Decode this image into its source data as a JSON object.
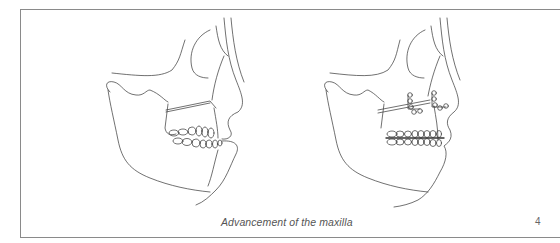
{
  "figure": {
    "caption": "Advancement of the maxilla",
    "page_number": "4",
    "panels": [
      {
        "name": "preoperative-skull-profile",
        "description": "Lateral skull line drawing showing maxillary osteotomy line before advancement"
      },
      {
        "name": "postoperative-skull-profile",
        "description": "Lateral skull line drawing with advanced maxilla fixed by two L-shaped bone plates with screws"
      }
    ],
    "colors": {
      "frame": "#8a8a8a",
      "line": "#333333",
      "caption": "#555555"
    }
  }
}
